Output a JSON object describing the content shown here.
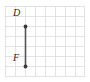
{
  "figure": {
    "type": "geometry-grid-diagram",
    "grid": {
      "columns": 8,
      "rows": 7,
      "cell_size_px": 10,
      "line_color": "#d8d8d8",
      "background": "#ffffff"
    },
    "segment": {
      "name": "segment-DF",
      "color": "#555555",
      "stroke_width": 1.6,
      "from": {
        "label": "D",
        "grid_x": 2,
        "grid_y": 2
      },
      "to": {
        "label": "F",
        "grid_x": 2,
        "grid_y": 6
      },
      "length_units": 4
    },
    "points": [
      {
        "label": "D",
        "grid_x": 2,
        "grid_y": 2,
        "marker": "filled-dot",
        "marker_color": "#444444"
      },
      {
        "label": "F",
        "grid_x": 2,
        "grid_y": 6,
        "marker": "filled-dot",
        "marker_color": "#444444"
      }
    ],
    "labels": {
      "top_point": "D",
      "bottom_point": "F"
    }
  }
}
